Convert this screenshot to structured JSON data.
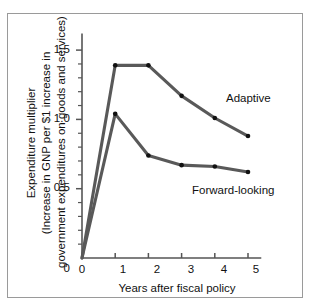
{
  "chart_data": {
    "type": "line",
    "title": "",
    "xlabel": "Years after fiscal policy",
    "ylabel": "Expenditure multiplier (Increase in GNP per $1 increase in government expenditures on goods and services)",
    "ylabel_lines": [
      "Expenditure multiplier",
      "(Increase in GNP per $1 increase in",
      "government expenditures on goods and services)"
    ],
    "x": [
      0,
      1,
      2,
      3,
      4,
      5
    ],
    "xlim": [
      0,
      5.4
    ],
    "ylim": [
      0,
      1.62
    ],
    "xticks": [
      "0",
      "1",
      "2",
      "3",
      "4",
      "5"
    ],
    "yticks": [
      "0",
      "0.5",
      "1.0",
      "1.5"
    ],
    "ytick_values": [
      0,
      0.5,
      1.0,
      1.5
    ],
    "yminor_step": 0.1,
    "grid": false,
    "legend_position": "inline-annotation",
    "series": [
      {
        "name": "Adaptive",
        "values": [
          0,
          1.39,
          1.39,
          1.17,
          1.01,
          0.88
        ],
        "color": "#595959"
      },
      {
        "name": "Forward-looking",
        "values": [
          0,
          1.04,
          0.74,
          0.67,
          0.66,
          0.62
        ],
        "color": "#595959"
      }
    ],
    "annotations": [
      {
        "text": "Adaptive",
        "x": 4.3,
        "y": 1.12
      },
      {
        "text": "Forward-looking",
        "x": 3.3,
        "y": 0.48
      }
    ],
    "colors": {
      "line": "#595959",
      "marker": "#111111",
      "axis": "#555555",
      "frame": "#9a9a9a",
      "background": "#ffffff",
      "text": "#111111"
    }
  }
}
